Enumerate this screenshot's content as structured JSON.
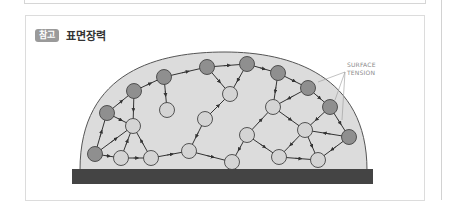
{
  "header": {
    "badge": "참고",
    "title": "표면장력"
  },
  "figure": {
    "label_line1": "SURFACE",
    "label_line2": "TENSION",
    "colors": {
      "droplet_fill": "#dcdcdc",
      "droplet_stroke": "#555555",
      "surface_molecule": "#8f8f8f",
      "interior_molecule": "#d4d4d4",
      "substrate": "#444444",
      "bond": "#333333"
    },
    "surface_molecules": [
      [
        95,
        154
      ],
      [
        107,
        113
      ],
      [
        134,
        91
      ],
      [
        164,
        77
      ],
      [
        207,
        67
      ],
      [
        247,
        64
      ],
      [
        278,
        73
      ],
      [
        308,
        88
      ],
      [
        330,
        107
      ],
      [
        349,
        137
      ]
    ],
    "interior_molecules": [
      [
        121,
        158
      ],
      [
        151,
        158
      ],
      [
        133,
        126
      ],
      [
        167,
        110
      ],
      [
        205,
        119
      ],
      [
        189,
        151
      ],
      [
        230,
        94
      ],
      [
        247,
        135
      ],
      [
        273,
        107
      ],
      [
        305,
        130
      ],
      [
        279,
        157
      ],
      [
        232,
        162
      ],
      [
        318,
        160
      ]
    ]
  }
}
